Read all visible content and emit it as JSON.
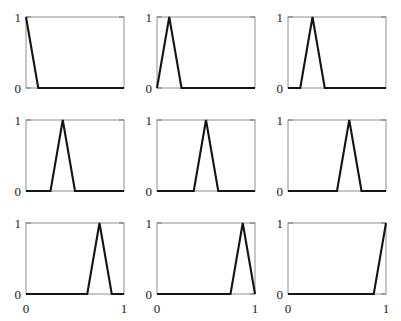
{
  "figure": {
    "title": "",
    "rows": 3,
    "cols": 3,
    "panel_count": 9,
    "background_color": "#ffffff",
    "line_color": "#141414",
    "frame_color": "#9a9a9a",
    "tick_color": "#7d7d7d"
  },
  "axes": {
    "x_tick_labels": [
      "0",
      "1"
    ],
    "x_tick_values": [
      0,
      1
    ],
    "y_tick_labels": [
      "0",
      "1"
    ],
    "y_tick_values": [
      0,
      1
    ],
    "xlim": [
      0,
      1
    ],
    "ylim": [
      0,
      1
    ],
    "grid": false,
    "xlabel": "",
    "ylabel": "",
    "x_labels_shown_on": "bottom-row-only",
    "y_labels_shown_on": "all-panels"
  },
  "chart_data": {
    "type": "line",
    "title": "",
    "xlabel": "",
    "ylabel": "",
    "xlim": [
      0,
      1
    ],
    "ylim": [
      0,
      1
    ],
    "grid": false,
    "legend": "none",
    "layout": {
      "rows": 3,
      "cols": 3
    },
    "panels": [
      {
        "index": 1,
        "peak_x": 0,
        "peak_y": 1,
        "shape": "half-triangle-left",
        "x": [
          0,
          0.125,
          1
        ],
        "y": [
          1,
          0,
          0
        ]
      },
      {
        "index": 2,
        "peak_x": 0.125,
        "peak_y": 1,
        "shape": "triangle",
        "x": [
          0,
          0.125,
          0.25,
          1
        ],
        "y": [
          0,
          1,
          0,
          0
        ]
      },
      {
        "index": 3,
        "peak_x": 0.25,
        "peak_y": 1,
        "shape": "triangle",
        "x": [
          0,
          0.125,
          0.25,
          0.375,
          1
        ],
        "y": [
          0,
          0,
          1,
          0,
          0
        ]
      },
      {
        "index": 4,
        "peak_x": 0.375,
        "peak_y": 1,
        "shape": "triangle",
        "x": [
          0,
          0.25,
          0.375,
          0.5,
          1
        ],
        "y": [
          0,
          0,
          1,
          0,
          0
        ]
      },
      {
        "index": 5,
        "peak_x": 0.5,
        "peak_y": 1,
        "shape": "triangle",
        "x": [
          0,
          0.375,
          0.5,
          0.625,
          1
        ],
        "y": [
          0,
          0,
          1,
          0,
          0
        ]
      },
      {
        "index": 6,
        "peak_x": 0.625,
        "peak_y": 1,
        "shape": "triangle",
        "x": [
          0,
          0.5,
          0.625,
          0.75,
          1
        ],
        "y": [
          0,
          0,
          1,
          0,
          0
        ]
      },
      {
        "index": 7,
        "peak_x": 0.75,
        "peak_y": 1,
        "shape": "triangle",
        "x": [
          0,
          0.625,
          0.75,
          0.875,
          1
        ],
        "y": [
          0,
          0,
          1,
          0,
          0
        ]
      },
      {
        "index": 8,
        "peak_x": 0.875,
        "peak_y": 1,
        "shape": "triangle",
        "x": [
          0,
          0.75,
          0.875,
          1
        ],
        "y": [
          0,
          0,
          1,
          0
        ]
      },
      {
        "index": 9,
        "peak_x": 1,
        "peak_y": 1,
        "shape": "half-triangle-right",
        "x": [
          0,
          0.875,
          1
        ],
        "y": [
          0,
          0,
          1
        ]
      }
    ]
  }
}
